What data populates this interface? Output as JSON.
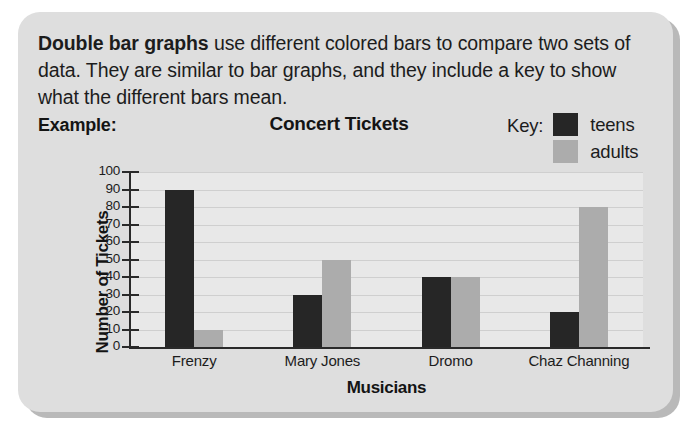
{
  "card": {
    "background_color": "#dedede",
    "shadow_color": "#b9b9b9"
  },
  "intro": {
    "lead": "Double bar graphs",
    "rest": " use different colored bars to compare two sets of data. They are similar to bar graphs, and they include a key to show what the different bars mean."
  },
  "example_label": "Example:",
  "key": {
    "label": "Key:",
    "entries": [
      {
        "name": "teens",
        "color": "#262626"
      },
      {
        "name": "adults",
        "color": "#acacac"
      }
    ]
  },
  "chart_data": {
    "type": "bar",
    "title": "Concert Tickets",
    "xlabel": "Musicians",
    "ylabel": "Number of Tickets",
    "categories": [
      "Frenzy",
      "Mary Jones",
      "Dromo",
      "Chaz Channing"
    ],
    "series": [
      {
        "name": "teens",
        "color": "#262626",
        "values": [
          90,
          30,
          40,
          20
        ]
      },
      {
        "name": "adults",
        "color": "#acacac",
        "values": [
          10,
          50,
          40,
          80
        ]
      }
    ],
    "ylim": [
      0,
      100
    ],
    "ytick_step": 10,
    "yticks": [
      0,
      10,
      20,
      30,
      40,
      50,
      60,
      70,
      80,
      90,
      100
    ],
    "grid": true,
    "legend_position": "top-right",
    "plot_background": "#e8e8e8",
    "axis_color": "#2a2a2a"
  }
}
